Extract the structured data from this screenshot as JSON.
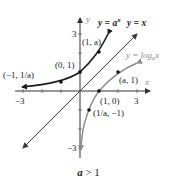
{
  "caption": {
    "var": "a",
    "relation": " > 1"
  },
  "axes": {
    "x_label": "x",
    "y_label": "y",
    "x_ticks": [
      "−3",
      "3"
    ],
    "y_ticks": [
      "3",
      "−3"
    ]
  },
  "curves": {
    "exponential": {
      "label": "y = a",
      "sup": "x",
      "color": "#1a1a1a"
    },
    "identity": {
      "label": "y = x",
      "color": "#3a3a3a"
    },
    "logarithm": {
      "label": "y = log",
      "sub": "a",
      "tail": "x",
      "color": "#8a8a8a"
    }
  },
  "points": {
    "p_neg1": "(−1, 1/a)",
    "p_0_1": "(0, 1)",
    "p_1_a": "(1, a)",
    "p_a_1": "(a, 1)",
    "p_1_0": "(1, 0)",
    "p_inv_a": "(1/a, −1)"
  },
  "colors": {
    "exp": "#1a1a1a",
    "log": "#8a8a8a",
    "identity": "#3a3a3a",
    "axis": "#333333"
  }
}
